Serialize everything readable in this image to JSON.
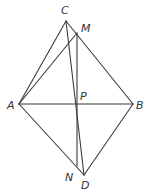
{
  "diagram": {
    "type": "geometry",
    "points": [
      {
        "id": "C",
        "label": "C"
      },
      {
        "id": "M",
        "label": "M"
      },
      {
        "id": "A",
        "label": "A"
      },
      {
        "id": "P",
        "label": "P"
      },
      {
        "id": "B",
        "label": "B"
      },
      {
        "id": "N",
        "label": "N"
      },
      {
        "id": "D",
        "label": "D"
      }
    ],
    "segments": [
      [
        "A",
        "C"
      ],
      [
        "C",
        "B"
      ],
      [
        "A",
        "D"
      ],
      [
        "D",
        "B"
      ],
      [
        "A",
        "B"
      ],
      [
        "A",
        "M"
      ],
      [
        "C",
        "D"
      ],
      [
        "M",
        "N"
      ]
    ],
    "colors": {
      "stroke": "#3a3a3a",
      "label": "#333333"
    }
  }
}
